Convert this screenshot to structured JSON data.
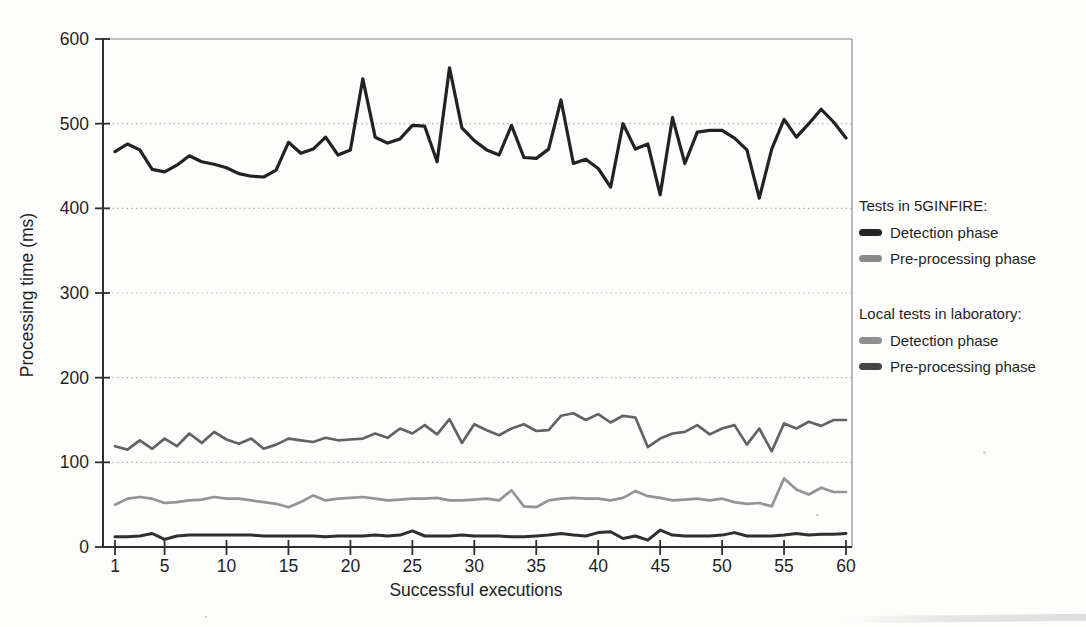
{
  "page": {
    "background": "#fdfdfc"
  },
  "chart_data": {
    "type": "line",
    "title": "",
    "xlabel": "Successful executions",
    "ylabel": "Processing time (ms)",
    "xlim": [
      1,
      60
    ],
    "ylim": [
      0,
      600
    ],
    "x_ticks": [
      1,
      5,
      10,
      15,
      20,
      25,
      30,
      35,
      40,
      45,
      50,
      55,
      60
    ],
    "y_ticks": [
      0,
      100,
      200,
      300,
      400,
      500,
      600
    ],
    "grid": {
      "horizontal": true,
      "style": "dotted",
      "color": "#b5b5b5"
    },
    "legend_position": "right-outside",
    "axis_color": "#2f2f2f",
    "border_color": "#8a8a8a",
    "x": [
      1,
      2,
      3,
      4,
      5,
      6,
      7,
      8,
      9,
      10,
      11,
      12,
      13,
      14,
      15,
      16,
      17,
      18,
      19,
      20,
      21,
      22,
      23,
      24,
      25,
      26,
      27,
      28,
      29,
      30,
      31,
      32,
      33,
      34,
      35,
      36,
      37,
      38,
      39,
      40,
      41,
      42,
      43,
      44,
      45,
      46,
      47,
      48,
      49,
      50,
      51,
      52,
      53,
      54,
      55,
      56,
      57,
      58,
      59,
      60
    ],
    "series": [
      {
        "id": "5ginfire-detection",
        "name": "Tests in 5GINFIRE - Detection phase",
        "color": "#222222",
        "values": [
          467,
          476,
          469,
          446,
          443,
          451,
          462,
          455,
          452,
          448,
          441,
          438,
          437,
          445,
          478,
          465,
          470,
          484,
          463,
          469,
          553,
          484,
          477,
          482,
          498,
          497,
          455,
          566,
          495,
          480,
          469,
          463,
          498,
          460,
          459,
          470,
          528,
          453,
          458,
          447,
          425,
          500,
          470,
          476,
          416,
          507,
          453,
          490,
          492,
          492,
          483,
          469,
          412,
          470,
          505,
          484,
          500,
          517,
          502,
          483
        ]
      },
      {
        "id": "5ginfire-preprocessing",
        "name": "Tests in 5GINFIRE - Pre-processing phase",
        "color": "#636363",
        "values": [
          119,
          115,
          126,
          116,
          128,
          119,
          134,
          123,
          136,
          127,
          122,
          128,
          116,
          121,
          128,
          126,
          124,
          129,
          126,
          127,
          128,
          134,
          129,
          140,
          134,
          144,
          133,
          151,
          123,
          145,
          138,
          132,
          140,
          145,
          137,
          138,
          155,
          158,
          150,
          157,
          147,
          155,
          153,
          118,
          128,
          134,
          136,
          144,
          133,
          140,
          144,
          121,
          140,
          113,
          146,
          140,
          148,
          143,
          150,
          150
        ]
      },
      {
        "id": "local-detection",
        "name": "Local tests in laboratory - Detection phase",
        "color": "#949494",
        "values": [
          50,
          57,
          59,
          57,
          52,
          53,
          55,
          56,
          59,
          57,
          57,
          55,
          53,
          51,
          47,
          53,
          61,
          55,
          57,
          58,
          59,
          57,
          55,
          56,
          57,
          57,
          58,
          55,
          55,
          56,
          57,
          55,
          67,
          48,
          47,
          55,
          57,
          58,
          57,
          57,
          55,
          58,
          66,
          60,
          58,
          55,
          56,
          57,
          55,
          57,
          53,
          51,
          52,
          48,
          81,
          68,
          62,
          70,
          65,
          65
        ]
      },
      {
        "id": "local-preprocessing",
        "name": "Local tests in laboratory - Pre-processing phase",
        "color": "#2f2f2f",
        "values": [
          12,
          12,
          13,
          16,
          9,
          13,
          14,
          14,
          14,
          14,
          14,
          14,
          13,
          13,
          13,
          13,
          13,
          12,
          13,
          13,
          13,
          14,
          13,
          14,
          19,
          13,
          13,
          13,
          14,
          13,
          13,
          13,
          12,
          12,
          13,
          14,
          16,
          14,
          13,
          17,
          18,
          10,
          13,
          8,
          20,
          14,
          13,
          13,
          13,
          14,
          17,
          13,
          13,
          13,
          14,
          16,
          14,
          15,
          15,
          16
        ]
      }
    ],
    "legend": {
      "groups": [
        {
          "header": "Tests in 5GINFIRE:",
          "items": [
            {
              "label": "Detection phase",
              "color": "#262626"
            },
            {
              "label": "Pre-processing phase",
              "color": "#8a8a8a"
            }
          ]
        },
        {
          "header": "Local tests in laboratory:",
          "items": [
            {
              "label": "Detection phase",
              "color": "#8f8f8f"
            },
            {
              "label": "Pre-processing phase",
              "color": "#454545"
            }
          ]
        }
      ]
    }
  }
}
